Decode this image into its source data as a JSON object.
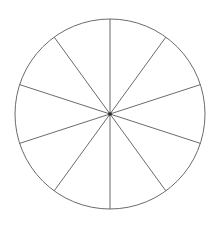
{
  "figure": {
    "name": "fraction-circle-tenths",
    "type": "geometry-diagram",
    "shape": "circle",
    "background_color": "#ffffff",
    "stroke_color": "#5a5a5a",
    "fill_color": "#ffffff",
    "center_dot_color": "#2a2a2a",
    "stroke_width": 0.9
  },
  "chart_data": {
    "type": "pie",
    "title": "",
    "subtitle": "",
    "xlabel": "",
    "ylabel": "",
    "legend": [],
    "grid": false,
    "labels_shown": false,
    "slice_count": 10,
    "slice_angle_degrees": 36,
    "categories": [
      "1",
      "2",
      "3",
      "4",
      "5",
      "6",
      "7",
      "8",
      "9",
      "10"
    ],
    "values": [
      10,
      10,
      10,
      10,
      10,
      10,
      10,
      10,
      10,
      10
    ],
    "fractions": [
      "1/10",
      "1/10",
      "1/10",
      "1/10",
      "1/10",
      "1/10",
      "1/10",
      "1/10",
      "1/10",
      "1/10"
    ],
    "slice_colors": [
      "#ffffff",
      "#ffffff",
      "#ffffff",
      "#ffffff",
      "#ffffff",
      "#ffffff",
      "#ffffff",
      "#ffffff",
      "#ffffff",
      "#ffffff"
    ],
    "annotations": []
  },
  "geometry": {
    "center_x": 110,
    "center_y": 114,
    "radius": 95,
    "start_angle_degrees": 90,
    "spoke_angles_degrees": [
      90,
      126,
      162,
      198,
      234,
      270,
      306,
      342,
      18,
      54
    ]
  },
  "canvas": {
    "width": 219,
    "height": 228
  }
}
